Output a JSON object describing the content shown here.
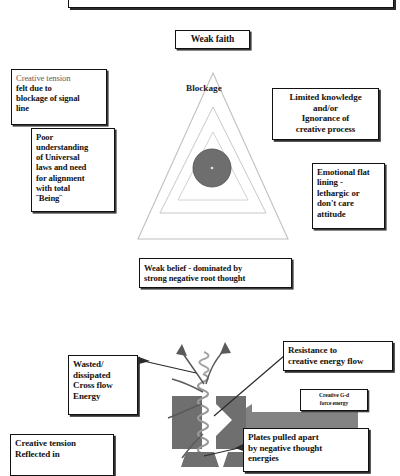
{
  "diagram": {
    "title_upper": "Blockage triangle diagram",
    "title_lower": "Energy plate mechanism diagram"
  },
  "upper": {
    "top_cut_box": "",
    "weak_faith": "Weak faith",
    "blockage_label": "Blockage",
    "creative_tension": {
      "line1": "Creative tension",
      "line2": "felt due to",
      "line3": "blockage of signal",
      "line4": "line"
    },
    "poor_understanding": {
      "line1": "Poor",
      "line2": "understanding",
      "line3": "of Universal",
      "line4": "laws and need",
      "line5": "for alignment",
      "line6": "with total",
      "line7": "˝Being˝"
    },
    "limited_knowledge": {
      "line1": "Limited knowledge",
      "line2": "and/or",
      "line3": "Ignorance of",
      "line4": "creative process"
    },
    "emotional_flat": {
      "line1": "Emotional flat",
      "line2": "lining -",
      "line3": "lethargic or",
      "line4": "don't care",
      "line5": "attitude"
    },
    "weak_belief": {
      "line1": "Weak belief - dominated by",
      "line2": "strong negative root thought"
    }
  },
  "lower": {
    "wasted": {
      "line1": "Wasted/",
      "line2": "dissipated",
      "line3": "Cross flow",
      "line4": "Energy"
    },
    "resistance": {
      "line1": "Resistance to",
      "line2": "creative energy flow"
    },
    "gd_force": {
      "line1": "Creative G-d",
      "line2": "force energy"
    },
    "plates": {
      "line1": "Plates pulled apart",
      "line2": "by negative thought",
      "line3": "energies"
    },
    "creative_reflected": {
      "line1": "Creative tension",
      "line2": "Reflected in"
    }
  },
  "colors": {
    "outline": "#111111",
    "triangle_stroke": "#b9b9b9",
    "circle_fill": "#6e6e6e",
    "plate_fill": "#6f6f6f",
    "arrow_fill": "#7d7d7d",
    "background": "#ffffff"
  }
}
